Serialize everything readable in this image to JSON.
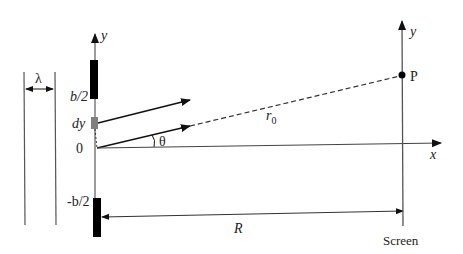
{
  "figure": {
    "labels": {
      "wavelength": "λ",
      "slit_y_axis": "y",
      "slit_top": "b/2",
      "slit_element": "dy",
      "origin": "0",
      "angle": "θ",
      "slit_bottom": "-b/2",
      "path_length_r": "r",
      "path_length_sub": "0",
      "distance": "R",
      "x_axis": "x",
      "screen_y_axis": "y",
      "point": "P",
      "screen": "Screen"
    },
    "colors": {
      "line": "#333333",
      "slit_bar": "#000000",
      "element_block": "#808080"
    }
  }
}
